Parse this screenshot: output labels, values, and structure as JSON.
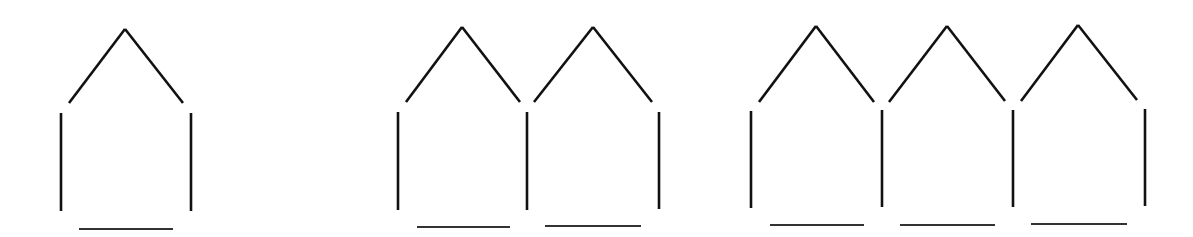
{
  "diagram": {
    "stroke_color": "#111111",
    "background": "#ffffff",
    "figures": [
      {
        "name": "one-house",
        "houses": 1,
        "roofs": [
          {
            "apex": [
              125,
              29
            ],
            "left": [
              69,
              103
            ],
            "right": [
              183,
              103
            ]
          }
        ],
        "walls": [
          {
            "x": 61,
            "y1": 113,
            "y2": 211
          },
          {
            "x": 191,
            "y1": 113,
            "y2": 211
          }
        ],
        "floors": [
          {
            "y": 229,
            "x1": 79,
            "x2": 173
          }
        ]
      },
      {
        "name": "two-houses",
        "houses": 2,
        "roofs": [
          {
            "apex": [
              462,
              27
            ],
            "left": [
              406,
              102
            ],
            "right": [
              520,
              102
            ]
          },
          {
            "apex": [
              593,
              27
            ],
            "left": [
              534,
              102
            ],
            "right": [
              652,
              102
            ]
          }
        ],
        "walls": [
          {
            "x": 398,
            "y1": 112,
            "y2": 210
          },
          {
            "x": 527,
            "y1": 112,
            "y2": 210
          },
          {
            "x": 659,
            "y1": 112,
            "y2": 209
          }
        ],
        "floors": [
          {
            "y": 227,
            "x1": 417,
            "x2": 510
          },
          {
            "y": 226,
            "x1": 545,
            "x2": 641
          }
        ]
      },
      {
        "name": "three-houses",
        "houses": 3,
        "roofs": [
          {
            "apex": [
              816,
              26
            ],
            "left": [
              759,
              102
            ],
            "right": [
              874,
              102
            ]
          },
          {
            "apex": [
              947,
              26
            ],
            "left": [
              889,
              102
            ],
            "right": [
              1005,
              101
            ]
          },
          {
            "apex": [
              1078,
              25
            ],
            "left": [
              1021,
              101
            ],
            "right": [
              1137,
              100
            ]
          }
        ],
        "walls": [
          {
            "x": 751,
            "y1": 111,
            "y2": 208
          },
          {
            "x": 882,
            "y1": 110,
            "y2": 207
          },
          {
            "x": 1013,
            "y1": 110,
            "y2": 207
          },
          {
            "x": 1145,
            "y1": 109,
            "y2": 206
          }
        ],
        "floors": [
          {
            "y": 225,
            "x1": 770,
            "x2": 864
          },
          {
            "y": 225,
            "x1": 900,
            "x2": 995
          },
          {
            "y": 224,
            "x1": 1031,
            "x2": 1127
          }
        ]
      }
    ]
  }
}
